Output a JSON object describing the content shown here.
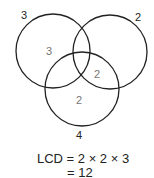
{
  "diagram": {
    "type": "venn",
    "circles": [
      {
        "name": "left",
        "outer_label": "3"
      },
      {
        "name": "right",
        "outer_label": "2"
      },
      {
        "name": "bottom",
        "outer_label": "4"
      }
    ],
    "regions": {
      "left_only": "3",
      "right_bottom_overlap": "2",
      "bottom_only": "2"
    },
    "equation": {
      "line1": "LCD = 2 × 2 × 3",
      "line2": "= 12"
    }
  }
}
